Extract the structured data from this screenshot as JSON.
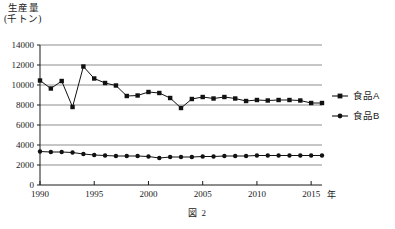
{
  "figure": {
    "caption": "図 2",
    "y_axis_title_line1": "生産量",
    "y_axis_title_line2": "(千トン)",
    "x_axis_unit": "年"
  },
  "chart_data": {
    "type": "line",
    "title": "生産量 (千トン)",
    "xlabel": "年",
    "ylabel": "生産量（千トン）",
    "xlim": [
      1990,
      2016
    ],
    "ylim": [
      0,
      14000
    ],
    "ytick_labels": [
      "0",
      "2000",
      "4000",
      "6000",
      "8000",
      "10000",
      "12000",
      "14000"
    ],
    "ytick_values": [
      0,
      2000,
      4000,
      6000,
      8000,
      10000,
      12000,
      14000
    ],
    "xtick_labels": [
      "1990",
      "1995",
      "2000",
      "2005",
      "2010",
      "2015"
    ],
    "xtick_values": [
      1990,
      1995,
      2000,
      2005,
      2010,
      2015
    ],
    "grid": "horizontal",
    "legend_position": "right",
    "x": [
      1990,
      1991,
      1992,
      1993,
      1994,
      1995,
      1996,
      1997,
      1998,
      1999,
      2000,
      2001,
      2002,
      2003,
      2004,
      2005,
      2006,
      2007,
      2008,
      2009,
      2010,
      2011,
      2012,
      2013,
      2014,
      2015,
      2016
    ],
    "series": [
      {
        "name": "食品A",
        "marker": "square",
        "values": [
          10450,
          9650,
          10400,
          7800,
          11850,
          10650,
          10200,
          9950,
          8900,
          8950,
          9300,
          9200,
          8700,
          7700,
          8600,
          8800,
          8650,
          8800,
          8650,
          8400,
          8500,
          8450,
          8500,
          8500,
          8450,
          8200,
          8200
        ]
      },
      {
        "name": "食品B",
        "marker": "circle",
        "values": [
          3350,
          3300,
          3300,
          3250,
          3100,
          3000,
          2950,
          2900,
          2900,
          2900,
          2850,
          2700,
          2800,
          2800,
          2800,
          2850,
          2850,
          2900,
          2900,
          2900,
          2950,
          2950,
          2950,
          2950,
          2950,
          2950,
          2950
        ]
      }
    ]
  },
  "legend": {
    "items": [
      {
        "label": "食品A",
        "marker": "square"
      },
      {
        "label": "食品B",
        "marker": "circle"
      }
    ]
  }
}
